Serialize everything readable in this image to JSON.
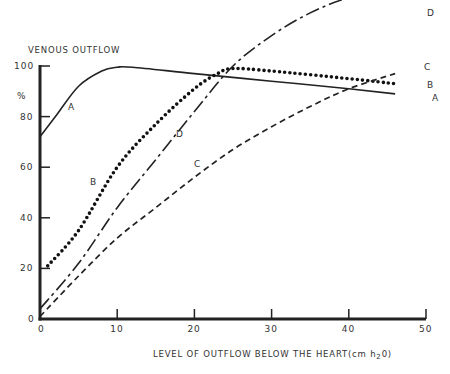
{
  "chart_data": {
    "type": "line",
    "title": "",
    "ylabel": "VENOUS OUTFLOW",
    "ylabel_unit": "%",
    "xlabel": "LEVEL OF OUTFLOW BELOW THE HEART",
    "xlabel_unit": "(cm h2O)",
    "xlim": [
      0,
      50
    ],
    "ylim": [
      0,
      100
    ],
    "xticks": [
      "0",
      "10",
      "20",
      "30",
      "40",
      "50"
    ],
    "yticks": [
      "0",
      "20",
      "40",
      "60",
      "80",
      "100"
    ],
    "grid": false,
    "legend": "inline curve labels",
    "series": [
      {
        "name": "A",
        "style": "solid",
        "x": [
          0,
          2,
          5,
          8,
          10,
          12,
          20,
          30,
          40,
          46
        ],
        "values": [
          72,
          80,
          92,
          98,
          99.5,
          99.5,
          97,
          94,
          91,
          89
        ]
      },
      {
        "name": "B",
        "style": "dotted",
        "x": [
          1,
          5,
          10,
          15,
          20,
          23,
          25,
          30,
          40,
          46
        ],
        "values": [
          21,
          35,
          60,
          77,
          91,
          97,
          99,
          98,
          95,
          93
        ]
      },
      {
        "name": "C",
        "style": "dashed",
        "x": [
          0,
          5,
          10,
          15,
          20,
          25,
          30,
          35,
          40,
          46
        ],
        "values": [
          1,
          17,
          32,
          44,
          56,
          67,
          76,
          84,
          91,
          97
        ]
      },
      {
        "name": "D",
        "style": "dash-dot",
        "x": [
          0,
          5,
          10,
          15,
          20,
          25,
          30,
          35,
          40,
          46
        ],
        "values": [
          4,
          22,
          44,
          63,
          82,
          100,
          112,
          121,
          127,
          131
        ]
      }
    ]
  }
}
